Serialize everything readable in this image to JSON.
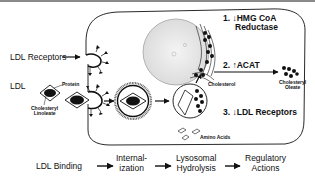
{
  "diagram": {
    "labels": {
      "ldl_receptors": "LDL Receptors",
      "ldl": "LDL",
      "protein": "Protein",
      "cholesteryl_linoleate_1": "Cholesteryl",
      "cholesteryl_linoleate_2": "Linoleate",
      "cholesterol": "Cholesterol",
      "cholesteryl_oleate_1": "Cholesteryl",
      "cholesteryl_oleate_2": "Oleate",
      "amino_acids": "Amino Acids"
    },
    "regulatory_actions": [
      {
        "number": "1.",
        "direction": "down",
        "arrow": "↓",
        "line1": "HMG CoA",
        "line2": "Reductase"
      },
      {
        "number": "2.",
        "direction": "up",
        "arrow": "↑",
        "line1": "ACAT"
      },
      {
        "number": "3.",
        "direction": "down",
        "arrow": "↓",
        "line1": "LDL Receptors"
      }
    ],
    "flow_steps": [
      {
        "line1": "LDL Binding",
        "line2": ""
      },
      {
        "line1": "Internal-",
        "line2": "ization"
      },
      {
        "line1": "Lysosomal",
        "line2": "Hydrolysis"
      },
      {
        "line1": "Regulatory",
        "line2": "Actions"
      }
    ],
    "colors": {
      "ink": "#111111",
      "background": "#ffffff",
      "nucleus": "#e8e8e8",
      "topline": "#8a8a8a"
    }
  }
}
